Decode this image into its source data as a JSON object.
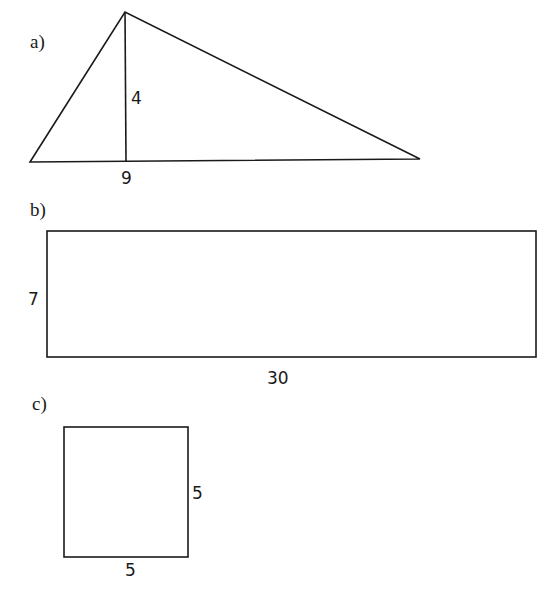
{
  "figures": {
    "a": {
      "label": "a)",
      "shape": "triangle",
      "height_label": "4",
      "base_label": "9"
    },
    "b": {
      "label": "b)",
      "shape": "rectangle",
      "height_label": "7",
      "width_label": "30"
    },
    "c": {
      "label": "c)",
      "shape": "square",
      "side_label": "5",
      "base_label": "5"
    }
  },
  "colors": {
    "stroke": "#1a1a1a",
    "background": "#ffffff"
  }
}
